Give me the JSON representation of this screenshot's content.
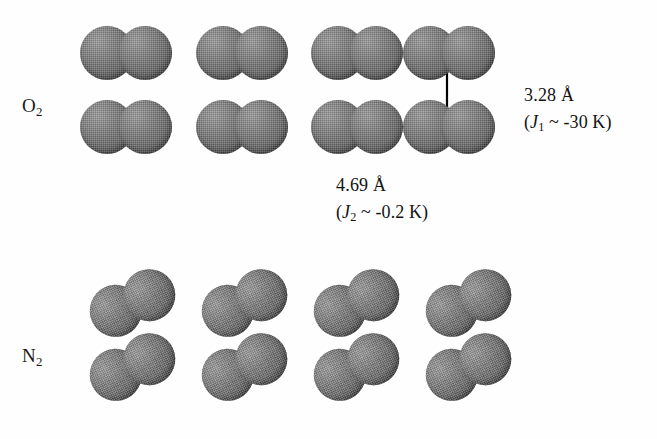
{
  "figure": {
    "background_color": "#fefefe",
    "molecule_color": "#6e6e6e",
    "annotation_color": "#131313"
  },
  "rows": [
    {
      "id": "oxygen",
      "label": "O",
      "label_sub": "2",
      "label_x": 22,
      "label_y": 95,
      "tilt_deg": 0,
      "atom_diameter": 54,
      "bond_overlap": 16,
      "columns_x": [
        80,
        196,
        311,
        403
      ],
      "rows_y": [
        26,
        100
      ]
    },
    {
      "id": "nitrogen",
      "label": "N",
      "label_sub": "2",
      "label_x": 22,
      "label_y": 345,
      "tilt_deg": -25,
      "atom_diameter": 52,
      "bond_overlap": 15,
      "columns_x": [
        88,
        200,
        312,
        424
      ],
      "rows_y": [
        277,
        341
      ]
    }
  ],
  "arrows": [
    {
      "id": "interlayer-arrow",
      "orientation": "vertical",
      "x1": 447,
      "y1": 50,
      "x2": 447,
      "y2": 127
    },
    {
      "id": "intralayer-arrow",
      "orientation": "horizontal",
      "x1": 322,
      "y1": 127,
      "x2": 447,
      "y2": 127
    }
  ],
  "annotations": [
    {
      "id": "interlayer-distance",
      "x": 524,
      "y": 82,
      "distance": "3.28  Å",
      "coupling_prefix": "(",
      "coupling_symbol": "J",
      "coupling_sub": "1",
      "coupling_value": " ~ -30 K)"
    },
    {
      "id": "intralayer-distance",
      "x": 336,
      "y": 172,
      "distance": "4.69  Å",
      "coupling_prefix": "(",
      "coupling_symbol": "J",
      "coupling_sub": "2",
      "coupling_value": " ~ -0.2 K)"
    }
  ],
  "chart_data": {
    "type": "diagram",
    "structures": [
      {
        "species": "O2",
        "rows": 2,
        "columns": 4,
        "orientation_deg": 0,
        "orientation_note": "molecular axis horizontal"
      },
      {
        "species": "N2",
        "rows": 2,
        "columns": 4,
        "orientation_deg": -25,
        "orientation_note": "molecular axis tilted, right atom raised"
      }
    ],
    "measurements": [
      {
        "label": "3.28  Å",
        "value": 3.28,
        "unit": "Å",
        "direction": "vertical (interlayer)",
        "coupling_symbol": "J1",
        "coupling_text": "(J1 ~ -30 K)",
        "coupling_value": -30,
        "coupling_unit": "K"
      },
      {
        "label": "4.69  Å",
        "value": 4.69,
        "unit": "Å",
        "direction": "horizontal (intralayer)",
        "coupling_symbol": "J2",
        "coupling_text": "(J2 ~ -0.2 K)",
        "coupling_value": -0.2,
        "coupling_unit": "K"
      }
    ]
  }
}
